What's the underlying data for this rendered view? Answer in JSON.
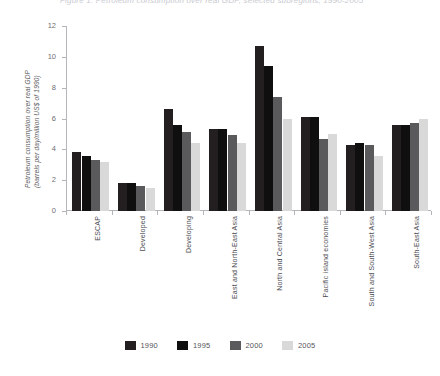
{
  "chart_data": {
    "type": "bar",
    "title": "Figure 1. Petroleum consumption over real GDP, selected subregions, 1990-2005",
    "xlabel": "",
    "ylabel_line1": "Petroleum consumption over real GDP",
    "ylabel_line2": "(barrels per day/million US$ of 1990)",
    "ylim": [
      0,
      12
    ],
    "yticks": [
      0,
      2,
      4,
      6,
      8,
      10,
      12
    ],
    "ytick_labels": [
      "0",
      "2",
      "4",
      "6",
      "8",
      "10",
      "12"
    ],
    "grid": false,
    "legend_position": "bottom",
    "categories": [
      "ESCAP",
      "Developed",
      "Developing",
      "East and North-East Asia",
      "North and Central Asia",
      "Pacific island economies",
      "South and South-West Asia",
      "South-East Asia"
    ],
    "series": [
      {
        "name": "1990",
        "color": "#231f20",
        "values": [
          3.8,
          1.8,
          6.6,
          5.3,
          10.7,
          6.1,
          4.3,
          5.6
        ]
      },
      {
        "name": "1995",
        "color": "#100f10",
        "values": [
          3.6,
          1.8,
          5.6,
          5.3,
          9.4,
          6.1,
          4.4,
          5.6
        ]
      },
      {
        "name": "2000",
        "color": "#5a5a5c",
        "values": [
          3.3,
          1.6,
          5.1,
          4.9,
          7.4,
          4.7,
          4.3,
          5.7
        ]
      },
      {
        "name": "2005",
        "color": "#d9d9d9",
        "values": [
          3.2,
          1.5,
          4.4,
          4.4,
          6.0,
          5.0,
          3.6,
          6.0
        ]
      }
    ]
  },
  "colors": {
    "axis": "#b4b4ba",
    "tick_text": "#6e6e74",
    "category_text": "#4c4c52",
    "legend_text": "#55555b",
    "background": "#ffffff"
  }
}
